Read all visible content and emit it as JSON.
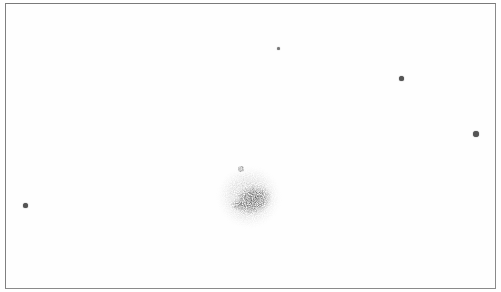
{
  "sketch": {
    "frame": {
      "x": 5,
      "y": 3,
      "width": 491,
      "height": 286,
      "border_color": "#8a8a8a",
      "background": "#fefefe"
    },
    "stars": [
      {
        "x": 25,
        "y": 205,
        "size": 5,
        "color": "#555555"
      },
      {
        "x": 278,
        "y": 48,
        "size": 3,
        "color": "#777777"
      },
      {
        "x": 401,
        "y": 78,
        "size": 5,
        "color": "#555555"
      },
      {
        "x": 476,
        "y": 134,
        "size": 6,
        "color": "#555555"
      }
    ],
    "nebula": {
      "cx": 250,
      "cy": 198,
      "radius": 32,
      "halo_color": "#d8d8d8",
      "core_color": "#4a4a4a"
    }
  }
}
